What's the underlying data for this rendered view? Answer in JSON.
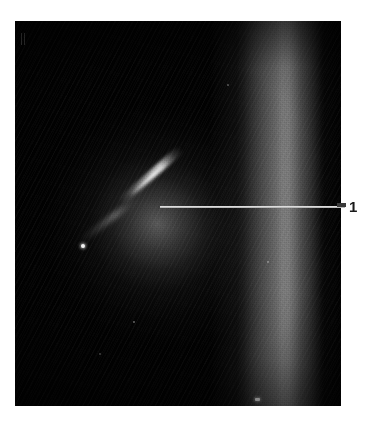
{
  "figure": {
    "kind": "astronomical-plate-photograph",
    "background_color": "#ffffff",
    "plate": {
      "color": "#010101",
      "left": 15,
      "top": 21,
      "width": 326,
      "height": 385
    }
  },
  "annotations": {
    "callouts": [
      {
        "id": "callout-1",
        "label": "1",
        "label_color": "#1a1a1a",
        "leader_line_color": "#b9b9b9",
        "points_to": "bright diagonal filament near plate centre",
        "leader_x_start": 160,
        "leader_x_end": 345,
        "leader_y": 207,
        "label_x": 349,
        "label_y": 198
      }
    ]
  },
  "sky_features": {
    "galactic_band": {
      "name": "bright vertical band",
      "color": "#bebebe",
      "center_x_fraction": 0.82
    },
    "nebula": {
      "name": "diffuse elliptical glow",
      "color": "#bebebe",
      "center_x": 142,
      "center_y": 202
    },
    "filament": {
      "name": "bright diagonal filament",
      "color": "#ebebeb"
    },
    "point_sources": [
      {
        "name": "bright-star-left",
        "x": 85,
        "y": 247
      },
      {
        "name": "bright-mark-bottom",
        "x": 258,
        "y": 400
      },
      {
        "name": "faint-star-a",
        "x": 133,
        "y": 321
      },
      {
        "name": "faint-star-b",
        "x": 227,
        "y": 84
      },
      {
        "name": "faint-star-c",
        "x": 99,
        "y": 353
      },
      {
        "name": "faint-star-d",
        "x": 267,
        "y": 261
      }
    ],
    "corner_ticks": {
      "name": "faint registration ticks",
      "x": 21,
      "y": 33
    }
  }
}
